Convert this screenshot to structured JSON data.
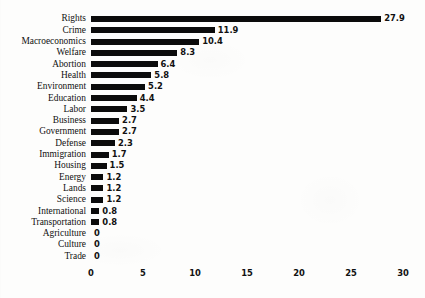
{
  "chart_data": {
    "type": "bar",
    "orientation": "horizontal",
    "title": "",
    "subtitle": "",
    "xlabel": "",
    "ylabel": "",
    "xlim": [
      0,
      30
    ],
    "xticks": [
      0,
      5,
      10,
      15,
      20,
      25,
      30
    ],
    "xtick_labels": [
      "0",
      "5",
      "10",
      "15",
      "20",
      "25",
      "30"
    ],
    "grid": false,
    "legend": null,
    "bar_color": "#0b0b0b",
    "background_color": "#fdfdfc",
    "categories": [
      "Rights",
      "Crime",
      "Macroeconomics",
      "Welfare",
      "Abortion",
      "Health",
      "Environment",
      "Education",
      "Labor",
      "Business",
      "Government",
      "Defense",
      "Immigration",
      "Housing",
      "Energy",
      "Lands",
      "Science",
      "International",
      "Transportation",
      "Agriculture",
      "Culture",
      "Trade"
    ],
    "values": [
      27.9,
      11.9,
      10.4,
      8.3,
      6.4,
      5.8,
      5.2,
      4.4,
      3.5,
      2.7,
      2.7,
      2.3,
      1.7,
      1.5,
      1.2,
      1.2,
      1.2,
      0.8,
      0.8,
      0,
      0,
      0
    ],
    "value_labels": [
      "27.9",
      "11.9",
      "10.4",
      "8.3",
      "6.4",
      "5.8",
      "5.2",
      "4.4",
      "3.5",
      "2.7",
      "2.7",
      "2.3",
      "1.7",
      "1.5",
      "1.2",
      "1.2",
      "1.2",
      "0.8",
      "0.8",
      "0",
      "0",
      "0"
    ]
  }
}
